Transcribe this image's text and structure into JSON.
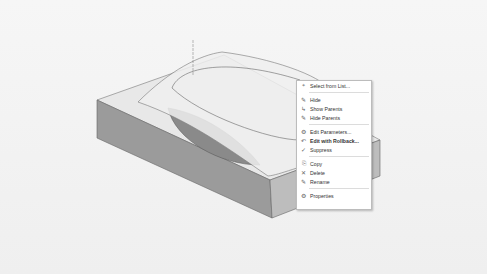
{
  "viewport": {
    "background": "#f3f3f3",
    "model": {
      "block_top_color": "#e6e6e6",
      "block_front_color": "#9a9a9a",
      "block_side_color": "#b8b8b8",
      "surface_color": "#eeeeee",
      "cavity_color": "#888888"
    }
  },
  "context_menu": {
    "items": [
      {
        "icon": "select-list-icon",
        "glyph": "⌖",
        "label": "Select from List..."
      },
      {
        "separator": true
      },
      {
        "icon": "hide-icon",
        "glyph": "✎",
        "label": "Hide"
      },
      {
        "icon": "show-parents-icon",
        "glyph": "↳",
        "label": "Show Parents"
      },
      {
        "icon": "hide-parents-icon",
        "glyph": "✎",
        "label": "Hide Parents"
      },
      {
        "separator": true
      },
      {
        "icon": "edit-parameters-icon",
        "glyph": "⚙",
        "label": "Edit Parameters..."
      },
      {
        "icon": "edit-rollback-icon",
        "glyph": "↶",
        "label": "Edit with Rollback...",
        "bold": true
      },
      {
        "icon": "suppress-icon",
        "glyph": "✓",
        "label": "Suppress"
      },
      {
        "separator": true
      },
      {
        "icon": "copy-icon",
        "glyph": "⎘",
        "label": "Copy"
      },
      {
        "icon": "delete-icon",
        "glyph": "✕",
        "label": "Delete"
      },
      {
        "icon": "rename-icon",
        "glyph": "✎",
        "label": "Rename"
      },
      {
        "separator": true
      },
      {
        "icon": "properties-icon",
        "glyph": "⚙",
        "label": "Properties"
      }
    ]
  }
}
